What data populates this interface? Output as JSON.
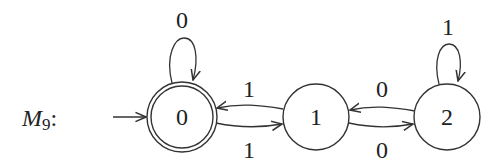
{
  "machine": {
    "name": "M",
    "subscript": "9",
    "suffix": ":"
  },
  "states": [
    {
      "id": "0",
      "label": "0",
      "start": true,
      "accepting": true
    },
    {
      "id": "1",
      "label": "1",
      "start": false,
      "accepting": false
    },
    {
      "id": "2",
      "label": "2",
      "start": false,
      "accepting": false
    }
  ],
  "transitions": [
    {
      "from": "0",
      "to": "0",
      "symbol": "0"
    },
    {
      "from": "1",
      "to": "0",
      "symbol": "1"
    },
    {
      "from": "0",
      "to": "1",
      "symbol": "1"
    },
    {
      "from": "2",
      "to": "1",
      "symbol": "0"
    },
    {
      "from": "1",
      "to": "2",
      "symbol": "0"
    },
    {
      "from": "2",
      "to": "2",
      "symbol": "1"
    }
  ]
}
